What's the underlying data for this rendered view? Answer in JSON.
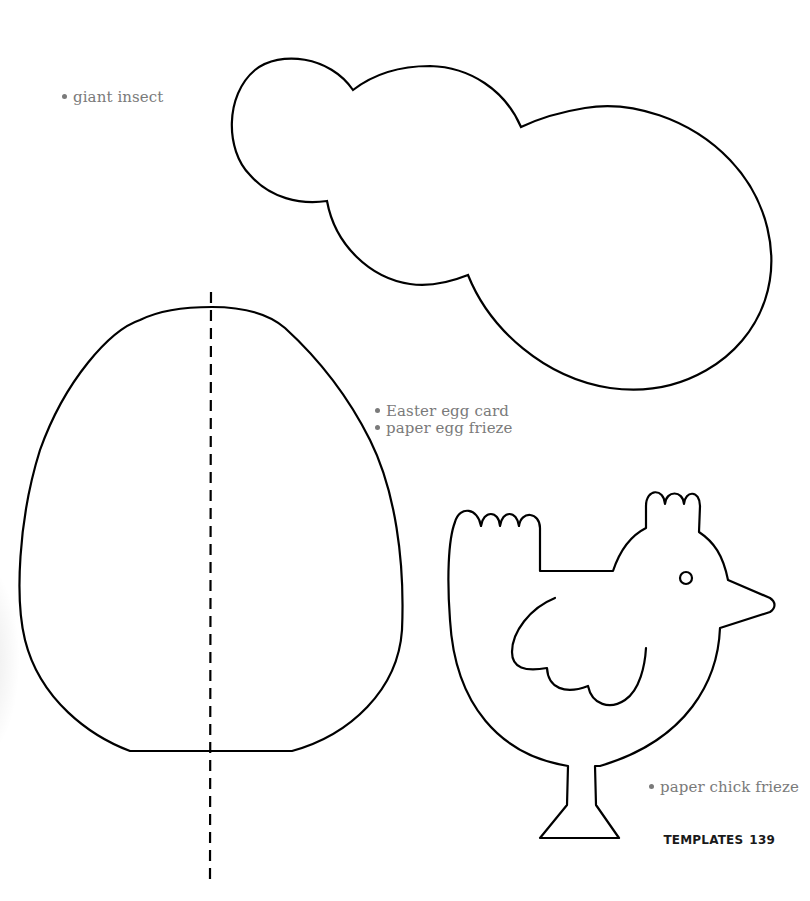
{
  "page": {
    "section": "TEMPLATES",
    "page_number": "139"
  },
  "templates": {
    "insect": {
      "uses": [
        "giant insect"
      ]
    },
    "egg": {
      "uses": [
        "Easter egg card",
        "paper egg frieze"
      ],
      "fold_line": "dashed"
    },
    "chick": {
      "uses": [
        "paper chick frieze"
      ]
    }
  },
  "colors": {
    "outline": "#000000",
    "label_text": "#7a7a7a",
    "folio_text": "#1a1a1a",
    "background": "#ffffff"
  }
}
